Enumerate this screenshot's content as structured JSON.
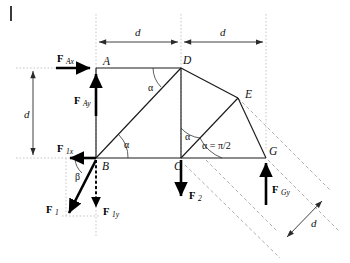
{
  "figure": {
    "type": "statics-free-body-diagram",
    "nodes": [
      {
        "id": "A",
        "label": "A",
        "x": 96,
        "y": 68
      },
      {
        "id": "B",
        "label": "B",
        "x": 96,
        "y": 158
      },
      {
        "id": "C",
        "label": "C",
        "x": 181,
        "y": 158
      },
      {
        "id": "D",
        "label": "D",
        "x": 181,
        "y": 68
      },
      {
        "id": "E",
        "label": "E",
        "x": 238,
        "y": 98
      },
      {
        "id": "G",
        "label": "G",
        "x": 266,
        "y": 158
      }
    ],
    "members": [
      {
        "from": "A",
        "to": "D"
      },
      {
        "from": "A",
        "to": "B"
      },
      {
        "from": "B",
        "to": "C"
      },
      {
        "from": "B",
        "to": "D"
      },
      {
        "from": "D",
        "to": "C"
      },
      {
        "from": "D",
        "to": "E"
      },
      {
        "from": "C",
        "to": "E"
      },
      {
        "from": "E",
        "to": "G"
      },
      {
        "from": "C",
        "to": "G"
      }
    ],
    "forces": [
      {
        "id": "F_Ax",
        "main": "F",
        "sub": "Ax",
        "at": "A",
        "direction": "right",
        "style": "solid"
      },
      {
        "id": "F_Ay",
        "main": "F",
        "sub": "Ay",
        "at": "A",
        "direction": "up",
        "style": "solid"
      },
      {
        "id": "F_1x",
        "main": "F",
        "sub": "1x",
        "at": "B",
        "direction": "left",
        "style": "solid"
      },
      {
        "id": "F_1y",
        "main": "F",
        "sub": "1y",
        "at": "B",
        "direction": "down",
        "style": "dashed"
      },
      {
        "id": "F_1",
        "main": "F",
        "sub": "1",
        "at": "B",
        "direction": "down-left-diagonal",
        "style": "solid"
      },
      {
        "id": "F_2",
        "main": "F",
        "sub": "2",
        "at": "C",
        "direction": "down",
        "style": "solid"
      },
      {
        "id": "F_Gy",
        "main": "F",
        "sub": "Gy",
        "at": "G",
        "direction": "up",
        "style": "solid"
      }
    ],
    "angles": [
      {
        "id": "alpha-at-D",
        "label": "α",
        "vertex": "D",
        "between": [
          "DA",
          "DB"
        ]
      },
      {
        "id": "alpha-at-B",
        "label": "α",
        "vertex": "B",
        "between": [
          "BC",
          "BD"
        ]
      },
      {
        "id": "alpha-at-C",
        "label": "α",
        "vertex": "C",
        "between": [
          "CD",
          "CE"
        ]
      },
      {
        "id": "alpha-half-pi",
        "label": "α = π/2",
        "vertex": "C",
        "between": [
          "CG",
          "CE"
        ]
      },
      {
        "id": "beta-at-B",
        "label": "β",
        "vertex": "B",
        "between": [
          "F1x",
          "F1"
        ]
      }
    ],
    "dimensions": [
      {
        "id": "dim-top-left",
        "label": "d",
        "orientation": "horizontal",
        "from": "A",
        "to": "D"
      },
      {
        "id": "dim-top-right",
        "label": "d",
        "orientation": "horizontal",
        "from": "D",
        "to": "G"
      },
      {
        "id": "dim-left",
        "label": "d",
        "orientation": "vertical",
        "from": "A",
        "to": "B"
      },
      {
        "id": "dim-diagonal",
        "label": "d",
        "orientation": "diagonal",
        "from": "E",
        "to": "G"
      }
    ]
  },
  "labels": {
    "node_A": "A",
    "node_B": "B",
    "node_C": "C",
    "node_D": "D",
    "node_E": "E",
    "node_G": "G",
    "alpha": "α",
    "beta": "β",
    "alpha_eq_half_pi": "α = π/2",
    "dim_d": "d",
    "force_symbol": "F",
    "sub_Ax": "Ax",
    "sub_Ay": "Ay",
    "sub_1x": "1x",
    "sub_1y": "1y",
    "sub_1": "1",
    "sub_2": "2",
    "sub_Gy": "Gy"
  },
  "colors": {
    "ink": "#1a1a1a",
    "force": "#000000",
    "construction_dotted": "#b9b9b9",
    "construction_dashed": "#9a9a9a",
    "background": "#ffffff"
  }
}
